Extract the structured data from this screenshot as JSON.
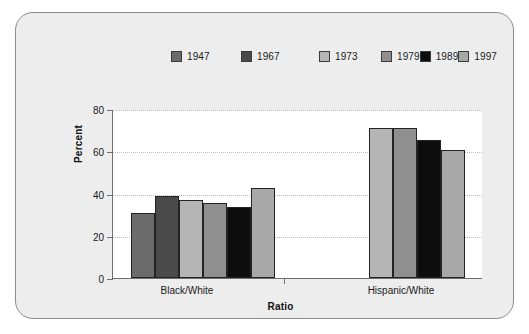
{
  "chart_data": {
    "type": "bar",
    "title": "",
    "xlabel": "Ratio",
    "ylabel": "Percent",
    "ylim": [
      0,
      80
    ],
    "yticks": [
      0,
      20,
      40,
      60,
      80
    ],
    "grid": true,
    "legend_position": "top-center",
    "categories": [
      "Black/White",
      "Hispanic/White"
    ],
    "series": [
      {
        "name": "1947",
        "color": "#6b6b6b",
        "values": [
          31,
          null
        ]
      },
      {
        "name": "1967",
        "color": "#4a4a4a",
        "values": [
          39,
          null
        ]
      },
      {
        "name": "1973",
        "color": "#b5b5b5",
        "values": [
          37,
          71
        ]
      },
      {
        "name": "1979",
        "color": "#8f8f8f",
        "values": [
          35.5,
          71
        ]
      },
      {
        "name": "1989",
        "color": "#0d0d0d",
        "values": [
          33.5,
          65.5
        ]
      },
      {
        "name": "1997",
        "color": "#a8a8a8",
        "values": [
          42.5,
          60.5
        ]
      }
    ]
  },
  "legend": {
    "items": [
      {
        "label": "1947",
        "color": "#6b6b6b"
      },
      {
        "label": "1967",
        "color": "#4a4a4a"
      },
      {
        "label": "1973",
        "color": "#b5b5b5"
      },
      {
        "label": "1979",
        "color": "#8f8f8f"
      },
      {
        "label": "1989",
        "color": "#0d0d0d"
      },
      {
        "label": "1997",
        "color": "#a8a8a8"
      }
    ]
  },
  "axes": {
    "y_title": "Percent",
    "y_ticks": [
      "0",
      "20",
      "40",
      "60",
      "80"
    ],
    "x_title": "Ratio",
    "x_group_labels": [
      "Black/White",
      "Hispanic/White"
    ]
  },
  "colors": {
    "card_background": "#ededed",
    "card_border": "#8c8c8c",
    "plot_background": "#ffffff",
    "axis": "#6e6e6e",
    "gridline": "#b9b9b9",
    "bar_outline": "#232323",
    "text": "#1a1a1a"
  }
}
